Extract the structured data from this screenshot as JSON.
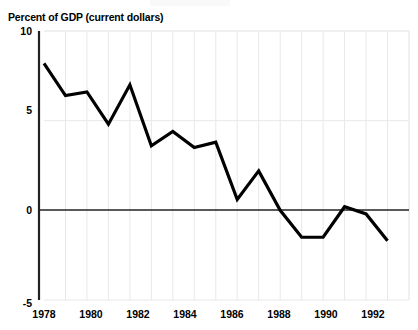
{
  "chart_data": {
    "type": "line",
    "title": "",
    "subtitle": "",
    "ylabel": "Percent of GDP (current dollars)",
    "xlabel": "",
    "ylim": [
      -5,
      10
    ],
    "xlim": [
      1977,
      1994
    ],
    "yticks": [
      -5,
      0,
      5,
      10
    ],
    "ytick_labels": [
      "-5",
      "0",
      "5",
      "10"
    ],
    "xticks": [
      1978,
      1980,
      1982,
      1984,
      1986,
      1988,
      1990,
      1992
    ],
    "xtick_labels": [
      "1978",
      "1980",
      "1982",
      "1984",
      "1986",
      "1988",
      "1990",
      "1992"
    ],
    "grid": "vertical-and-horizontal-light",
    "legend": "none",
    "zero_line": true,
    "line_color": "#000000",
    "line_width": 3.2,
    "grid_color": "#e8e8e8",
    "axis_color": "#222222",
    "series": [
      {
        "name": "Percent of GDP (current dollars)",
        "x": [
          1977,
          1978,
          1979,
          1980,
          1981,
          1982,
          1983,
          1984,
          1985,
          1986,
          1987,
          1988,
          1989,
          1990,
          1991,
          1992,
          1993
        ],
        "values": [
          8.2,
          6.4,
          6.6,
          4.8,
          7.0,
          3.6,
          4.4,
          3.5,
          3.8,
          0.6,
          2.2,
          0.0,
          -1.5,
          -1.5,
          0.2,
          -0.2,
          -1.7
        ]
      }
    ]
  },
  "axis": {
    "y_title": "Percent of GDP (current dollars)",
    "y_labels": [
      "10",
      "5",
      "0",
      "-5"
    ],
    "x_labels": [
      "1978",
      "1980",
      "1982",
      "1984",
      "1986",
      "1988",
      "1990",
      "1992"
    ]
  }
}
